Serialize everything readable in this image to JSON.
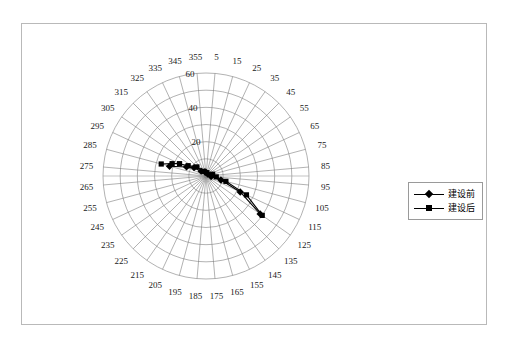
{
  "figure": {
    "frame_border_color": "#b9b9b9",
    "background": "#ffffff"
  },
  "legend": {
    "position": "right",
    "items": [
      {
        "label": "建设前",
        "marker": "diamond",
        "color": "#000000"
      },
      {
        "label": "建设后",
        "marker": "square",
        "color": "#000000"
      }
    ]
  },
  "chart_data": {
    "type": "line",
    "subtype": "polar",
    "title": "",
    "xlabel": "",
    "ylabel": "",
    "grid": true,
    "legend_position": "right",
    "angular_axis": {
      "unit": "degrees",
      "start": 5,
      "step": 10,
      "direction": "clockwise",
      "zero_at": "top",
      "tick_labels": [
        "5",
        "15",
        "25",
        "35",
        "45",
        "55",
        "65",
        "75",
        "85",
        "95",
        "105",
        "115",
        "125",
        "135",
        "145",
        "155",
        "165",
        "175",
        "185",
        "195",
        "205",
        "215",
        "225",
        "235",
        "245",
        "255",
        "265",
        "275",
        "285",
        "295",
        "305",
        "315",
        "325",
        "335",
        "345",
        "355"
      ]
    },
    "radial_axis": {
      "min": 0,
      "max": 60,
      "tick_labels": [
        "20",
        "40",
        "60"
      ],
      "ticks": [
        20,
        40,
        60
      ],
      "label_angle_deg": 355
    },
    "series": [
      {
        "name": "建设前",
        "marker": "diamond",
        "color": "#000000",
        "points": [
          {
            "angle": 285,
            "value": 22.0
          },
          {
            "angle": 295,
            "value": 12.5
          },
          {
            "angle": 305,
            "value": 8.5
          },
          {
            "angle": 315,
            "value": 4.0
          },
          {
            "angle": 345,
            "value": 2.5
          },
          {
            "angle": 5,
            "value": 2.0
          },
          {
            "angle": 45,
            "value": 1.5
          },
          {
            "angle": 95,
            "value": 3.0
          },
          {
            "angle": 105,
            "value": 9.0
          },
          {
            "angle": 115,
            "value": 22.0
          },
          {
            "angle": 125,
            "value": 38.5
          }
        ]
      },
      {
        "name": "建设后",
        "marker": "square",
        "color": "#000000",
        "points": [
          {
            "angle": 285,
            "value": 27.0
          },
          {
            "angle": 290,
            "value": 21.0
          },
          {
            "angle": 295,
            "value": 17.0
          },
          {
            "angle": 300,
            "value": 12.0
          },
          {
            "angle": 315,
            "value": 7.5
          },
          {
            "angle": 335,
            "value": 3.0
          },
          {
            "angle": 15,
            "value": 2.0
          },
          {
            "angle": 75,
            "value": 4.0
          },
          {
            "angle": 95,
            "value": 6.0
          },
          {
            "angle": 105,
            "value": 12.0
          },
          {
            "angle": 115,
            "value": 26.0
          },
          {
            "angle": 125,
            "value": 40.0
          }
        ]
      }
    ]
  }
}
